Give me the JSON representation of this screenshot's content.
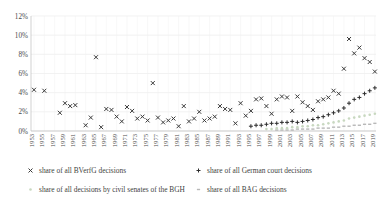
{
  "chart_data": {
    "type": "scatter",
    "title": "",
    "xlabel": "",
    "ylabel": "",
    "ylim": [
      0,
      12
    ],
    "ytick_labels": [
      "0%",
      "2%",
      "4%",
      "6%",
      "8%",
      "10%",
      "12%"
    ],
    "ytick_values": [
      0,
      2,
      4,
      6,
      8,
      10,
      12
    ],
    "grid": true,
    "legend_position": "bottom",
    "x": [
      1953,
      1954,
      1955,
      1956,
      1957,
      1958,
      1959,
      1960,
      1961,
      1962,
      1963,
      1964,
      1965,
      1966,
      1967,
      1968,
      1969,
      1970,
      1971,
      1972,
      1973,
      1974,
      1975,
      1976,
      1977,
      1978,
      1979,
      1980,
      1981,
      1982,
      1983,
      1984,
      1985,
      1986,
      1987,
      1988,
      1989,
      1990,
      1991,
      1992,
      1993,
      1994,
      1995,
      1996,
      1997,
      1998,
      1999,
      2000,
      2001,
      2002,
      2003,
      2004,
      2005,
      2006,
      2007,
      2008,
      2009,
      2010,
      2011,
      2012,
      2013,
      2014,
      2015,
      2016,
      2017,
      2018,
      2019
    ],
    "xtick_labels": [
      "1953",
      "1955",
      "1957",
      "1959",
      "1961",
      "1963",
      "1965",
      "1967",
      "1969",
      "1971",
      "1973",
      "1975",
      "1977",
      "1979",
      "1981",
      "1983",
      "1985",
      "1987",
      "1989",
      "1991",
      "1993",
      "1995",
      "1997",
      "1999",
      "2001",
      "2003",
      "2005",
      "2007",
      "2009",
      "2011",
      "2013",
      "2015",
      "2017",
      "2019"
    ],
    "series": [
      {
        "name": "share of all BVerfG decisions",
        "marker": "x",
        "color": "#3a3a3a",
        "values": [
          4.3,
          null,
          4.2,
          null,
          null,
          1.9,
          2.9,
          2.6,
          2.7,
          null,
          0.6,
          1.4,
          7.7,
          0.4,
          2.3,
          2.2,
          1.5,
          1.0,
          2.5,
          2.1,
          1.3,
          1.5,
          1.1,
          5.0,
          1.4,
          0.9,
          1.1,
          1.3,
          0.5,
          2.6,
          1.0,
          1.3,
          2.0,
          1.1,
          1.3,
          1.5,
          2.6,
          2.3,
          2.2,
          0.8,
          2.9,
          1.6,
          2.1,
          3.3,
          3.4,
          2.6,
          1.8,
          3.3,
          3.6,
          3.5,
          2.1,
          3.6,
          3.0,
          2.6,
          2.2,
          3.1,
          3.3,
          3.5,
          4.2,
          3.9,
          6.5,
          9.6,
          8.1,
          8.7,
          7.6,
          7.2,
          6.2
        ]
      },
      {
        "name": "share of all German court decisions",
        "marker": "+",
        "color": "#2d2d2d",
        "values": [
          null,
          null,
          null,
          null,
          null,
          null,
          null,
          null,
          null,
          null,
          null,
          null,
          null,
          null,
          null,
          null,
          null,
          null,
          null,
          null,
          null,
          null,
          null,
          null,
          null,
          null,
          null,
          null,
          null,
          null,
          null,
          null,
          null,
          null,
          null,
          null,
          null,
          null,
          null,
          null,
          null,
          null,
          0.5,
          0.6,
          0.6,
          0.7,
          0.8,
          0.8,
          0.9,
          0.9,
          1.0,
          0.9,
          1.0,
          1.1,
          1.2,
          1.4,
          1.5,
          1.7,
          1.9,
          2.1,
          2.4,
          2.9,
          3.3,
          3.5,
          3.9,
          4.2,
          4.5
        ]
      },
      {
        "name": "share of all decisions by civil senates of the BGH",
        "marker": "dot",
        "color": "#c8d8c0",
        "values": [
          null,
          null,
          null,
          null,
          null,
          null,
          null,
          null,
          null,
          null,
          null,
          null,
          null,
          null,
          null,
          null,
          null,
          null,
          null,
          null,
          null,
          null,
          null,
          null,
          null,
          null,
          null,
          null,
          null,
          null,
          null,
          null,
          null,
          null,
          null,
          null,
          null,
          null,
          null,
          null,
          null,
          null,
          null,
          null,
          null,
          0.2,
          0.2,
          0.3,
          0.3,
          0.3,
          0.4,
          0.4,
          0.5,
          0.5,
          0.6,
          0.6,
          0.7,
          0.8,
          0.9,
          1.0,
          1.1,
          1.3,
          1.4,
          1.5,
          1.6,
          1.7,
          1.8
        ]
      },
      {
        "name": "share of all BAG decisions",
        "marker": "dash",
        "color": "#b8b8b8",
        "values": [
          null,
          null,
          null,
          null,
          null,
          null,
          null,
          null,
          null,
          null,
          null,
          null,
          null,
          null,
          null,
          null,
          null,
          null,
          null,
          null,
          null,
          null,
          null,
          null,
          null,
          null,
          null,
          null,
          null,
          null,
          null,
          null,
          null,
          null,
          null,
          null,
          null,
          null,
          null,
          null,
          null,
          null,
          null,
          null,
          null,
          null,
          null,
          0.1,
          0.1,
          0.1,
          0.1,
          0.2,
          0.2,
          0.2,
          0.2,
          0.3,
          0.3,
          0.3,
          0.4,
          0.4,
          0.5,
          0.5,
          0.6,
          0.6,
          0.7,
          0.7,
          0.8
        ]
      }
    ]
  },
  "legend": {
    "items": [
      {
        "label": "share of all BVerfG decisions",
        "marker": "x",
        "color": "#3a3a3a"
      },
      {
        "label": "share of all German court decisions",
        "marker": "+",
        "color": "#2d2d2d"
      },
      {
        "label": "share of all decisions by civil senates of the BGH",
        "marker": "dot",
        "color": "#c8d8c0"
      },
      {
        "label": "share of all BAG decisions",
        "marker": "dash",
        "color": "#b8b8b8"
      }
    ]
  }
}
